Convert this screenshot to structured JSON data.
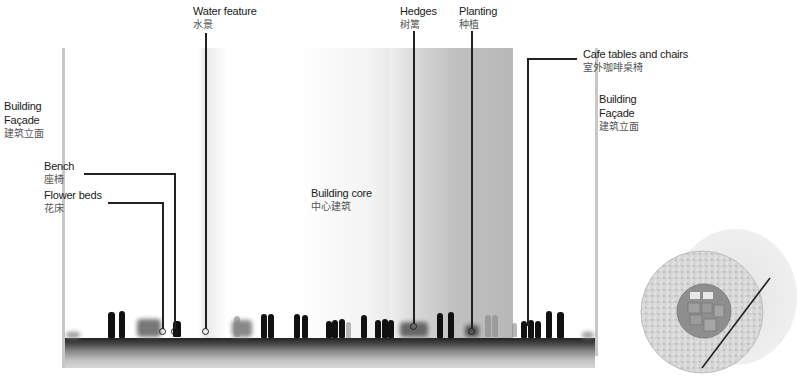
{
  "diagram": {
    "type": "architectural-section",
    "labels": {
      "water_feature": {
        "en": "Water feature",
        "cn": "水景"
      },
      "hedges": {
        "en": "Hedges",
        "cn": "树篱"
      },
      "planting": {
        "en": "Planting",
        "cn": "种植"
      },
      "cafe": {
        "en": "Cafe tables and chairs",
        "cn": "室外咖啡桌椅"
      },
      "facade_left": {
        "en1": "Building",
        "en2": "Façade",
        "cn": "建筑立面"
      },
      "facade_right": {
        "en1": "Building",
        "en2": "Façade",
        "cn": "建筑立面"
      },
      "bench": {
        "en": "Bench",
        "cn": "座椅"
      },
      "flower_beds": {
        "en": "Flower beds",
        "cn": "花床"
      },
      "building_core": {
        "en": "Building core",
        "cn": "中心建筑"
      }
    },
    "key_plan": {
      "name": "circular site plan with section cut line"
    }
  },
  "colors": {
    "ink": "#222222",
    "core_gray": "#b4b4b4",
    "ground_dark": "#2a2a2a",
    "ground_light": "#d4d4d4",
    "facade_line": "#c8c8c8"
  }
}
